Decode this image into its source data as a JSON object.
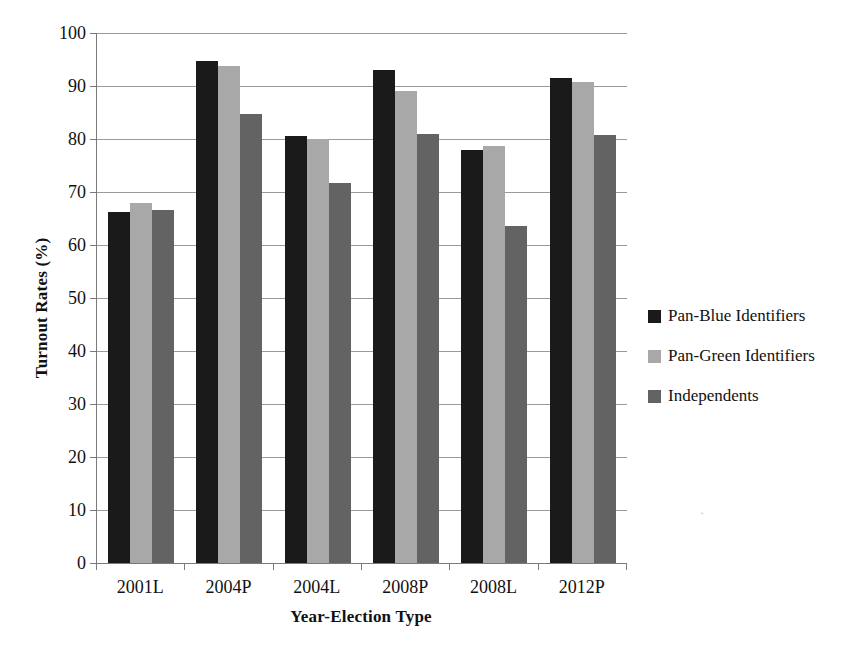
{
  "chart_data": {
    "type": "bar",
    "title": "",
    "subtitle": "",
    "xlabel": "Year-Election Type",
    "ylabel": "Turnout Rates (%)",
    "categories": [
      "2001L",
      "2004P",
      "2004L",
      "2008P",
      "2008L",
      "2012P"
    ],
    "series": [
      {
        "name": "Pan-Blue Identifiers",
        "color": "#1a1a1a",
        "values": [
          66.2,
          94.8,
          80.6,
          93.0,
          77.9,
          91.6
        ]
      },
      {
        "name": "Pan-Green Identifiers",
        "color": "#a8a8a8",
        "values": [
          67.9,
          93.8,
          80.0,
          89.0,
          78.6,
          90.8
        ]
      },
      {
        "name": "Independents",
        "color": "#636363",
        "values": [
          66.7,
          84.8,
          71.7,
          81.0,
          63.6,
          80.8
        ]
      }
    ],
    "ylim": [
      0,
      100
    ],
    "ytick_values": [
      0,
      10,
      20,
      30,
      40,
      50,
      60,
      70,
      80,
      90,
      100
    ],
    "ytick_labels": [
      "0",
      "10",
      "20",
      "30",
      "40",
      "50",
      "60",
      "70",
      "80",
      "90",
      "100"
    ],
    "grid": true,
    "grid_axis": "y",
    "legend_position": "right",
    "bar_group_gap": true,
    "background": "#ffffff",
    "axis_color": "#7a7a7a",
    "gridline_color": "#9a9a9a"
  },
  "legend": {
    "items": [
      {
        "label": "Pan-Blue Identifiers",
        "swatch": "s0"
      },
      {
        "label": "Pan-Green Identifiers",
        "swatch": "s1"
      },
      {
        "label": "Independents",
        "swatch": "s2"
      }
    ]
  },
  "artifacts": {
    "scan_speck": "·"
  }
}
